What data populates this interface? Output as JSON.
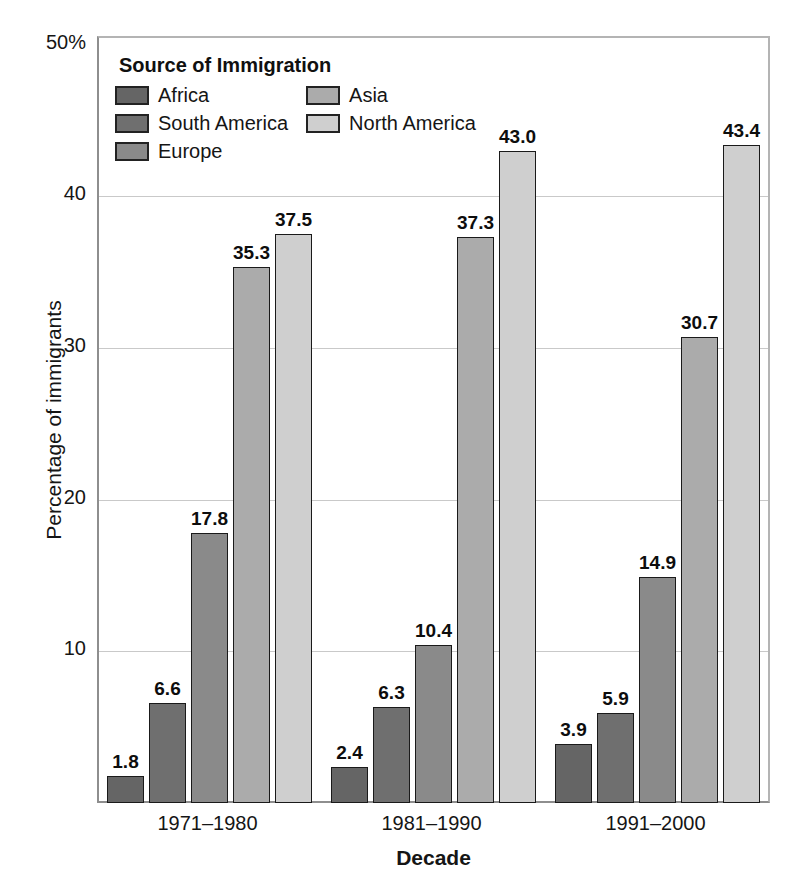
{
  "chart_data": {
    "type": "bar",
    "title": "",
    "xlabel": "Decade",
    "ylabel": "Percentage of immigrants",
    "categories": [
      "1971–1980",
      "1981–1990",
      "1991–2000"
    ],
    "series": [
      {
        "name": "Africa",
        "values": [
          1.8,
          2.4,
          3.9
        ],
        "color": "#656565"
      },
      {
        "name": "South America",
        "values": [
          6.6,
          6.3,
          5.9
        ],
        "color": "#6f6f6f"
      },
      {
        "name": "Europe",
        "values": [
          17.8,
          10.4,
          14.9
        ],
        "color": "#8a8a8a"
      },
      {
        "name": "Asia",
        "values": [
          35.3,
          37.3,
          30.7
        ],
        "color": "#ababab"
      },
      {
        "name": "North America",
        "values": [
          37.5,
          43.0,
          43.4
        ],
        "color": "#cfcfcf"
      }
    ],
    "ylim": [
      0,
      50
    ],
    "yticks": [
      "50%",
      "40",
      "30",
      "20",
      "10"
    ],
    "ytick_values": [
      50,
      40,
      30,
      20,
      10
    ],
    "grid": true,
    "legend_position": "inside-top-left",
    "legend_title": "Source of Immigration",
    "bar_label_format": "one-decimal"
  },
  "axes": {
    "y_title": "Percentage of immigrants",
    "x_title": "Decade"
  },
  "legend": {
    "title": "Source of Immigration",
    "column_left": [
      {
        "label": "Africa",
        "color": "#656565"
      },
      {
        "label": "South America",
        "color": "#6f6f6f"
      },
      {
        "label": "Europe",
        "color": "#8a8a8a"
      }
    ],
    "column_right": [
      {
        "label": "Asia",
        "color": "#ababab"
      },
      {
        "label": "North America",
        "color": "#cfcfcf"
      }
    ]
  }
}
